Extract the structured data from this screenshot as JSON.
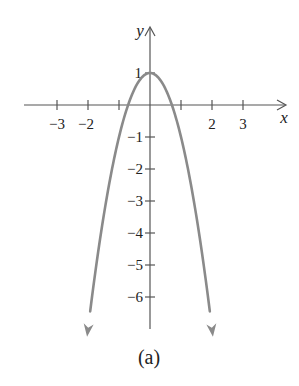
{
  "chart_data": {
    "type": "line",
    "title": "",
    "caption": "(a)",
    "function": "y = 1 - 2x^2",
    "xlabel": "x",
    "ylabel": "y",
    "xlim": [
      -3.9,
      4.4
    ],
    "ylim": [
      -7.0,
      2.4
    ],
    "x_ticks": [
      -3,
      -2,
      -1,
      1,
      2,
      3
    ],
    "x_tick_labels": [
      "−3",
      "−2",
      "",
      "",
      "2",
      "3"
    ],
    "y_ticks": [
      1,
      -1,
      -2,
      -3,
      -4,
      -5,
      -6
    ],
    "y_tick_labels": [
      "1",
      "−1",
      "−2",
      "−3",
      "−4",
      "−5",
      "−6"
    ],
    "grid": false,
    "legend": null,
    "series": [
      {
        "name": "parabola",
        "color": "#8a8a8a",
        "x": [
          -2.03,
          -1.5,
          -1,
          -0.707,
          -0.5,
          0,
          0.5,
          0.707,
          1,
          1.5,
          2.03
        ],
        "y": [
          -7.24,
          -3.5,
          -1,
          0,
          0.5,
          1,
          0.5,
          0,
          -1,
          -3.5,
          -7.24
        ],
        "arrows_at_ends": true
      }
    ],
    "key_points": {
      "vertex": [
        0,
        1
      ],
      "x_intercepts": [
        -0.707,
        0.707
      ]
    }
  },
  "colors": {
    "axis": "#555555",
    "curve": "#8a8a8a",
    "text": "#222222"
  }
}
